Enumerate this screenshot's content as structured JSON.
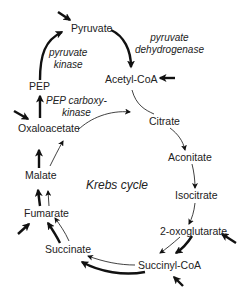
{
  "diagram": {
    "title": "Krebs cycle",
    "metabolites": {
      "pyruvate": "Pyruvate",
      "acetyl_coa": "Acetyl-CoA",
      "citrate": "Citrate",
      "aconitate": "Aconitate",
      "isocitrate": "Isocitrate",
      "oxoglutarate": "2-oxoglutarate",
      "succinyl_coa": "Succinyl-CoA",
      "succinate": "Succinate",
      "fumarate": "Fumarate",
      "malate": "Malate",
      "oxaloacetate": "Oxaloacetate",
      "pep": "PEP"
    },
    "enzymes": {
      "pyruvate_kinase": [
        "pyruvate",
        "kinase"
      ],
      "pyruvate_dehydrogenase": [
        "pyruvate",
        "dehydrogenase"
      ],
      "pep_carboxykinase": [
        "PEP carboxy-",
        "kinase"
      ]
    },
    "colors": {
      "line": "#111111",
      "text": "#222222",
      "background": "#ffffff"
    }
  }
}
